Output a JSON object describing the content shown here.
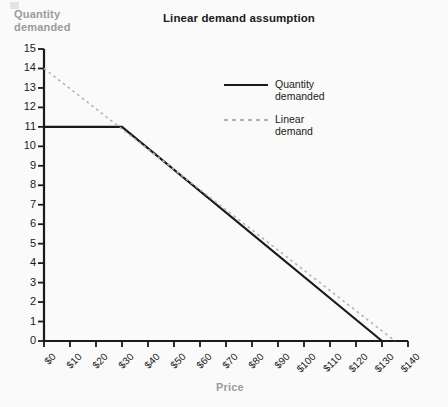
{
  "chart_data": {
    "type": "line",
    "title": "Linear demand assumption",
    "xlabel": "Price",
    "ylabel": "Quantity\ndemanded",
    "xlim": [
      0,
      140
    ],
    "ylim": [
      0,
      15
    ],
    "grid": false,
    "legend_position": "upper-center-right",
    "x_tick_labels": [
      "$0",
      "$10",
      "$20",
      "$30",
      "$40",
      "$50",
      "$60",
      "$70",
      "$80",
      "$90",
      "$100",
      "$110",
      "$120",
      "$130",
      "$140"
    ],
    "x_tick_values": [
      0,
      10,
      20,
      30,
      40,
      50,
      60,
      70,
      80,
      90,
      100,
      110,
      120,
      130,
      140
    ],
    "y_tick_labels": [
      "0",
      "1",
      "2",
      "3",
      "4",
      "5",
      "6",
      "7",
      "8",
      "9",
      "10",
      "11",
      "12",
      "13",
      "14",
      "15"
    ],
    "y_tick_values": [
      0,
      1,
      2,
      3,
      4,
      5,
      6,
      7,
      8,
      9,
      10,
      11,
      12,
      13,
      14,
      15
    ],
    "series": [
      {
        "name": "Quantity\ndemanded",
        "legend_label": "Quantity\ndemanded",
        "style": "solid",
        "color": "#1a1a1a",
        "width": 2.2,
        "points": [
          [
            0,
            11
          ],
          [
            30,
            11
          ],
          [
            130,
            0
          ]
        ]
      },
      {
        "name": "Linear\ndemand",
        "legend_label": "Linear\ndemand",
        "style": "dashed",
        "color": "#b3b3b3",
        "width": 1.6,
        "points": [
          [
            0,
            14
          ],
          [
            135,
            0
          ]
        ]
      }
    ]
  },
  "colors": {
    "background": "#fafafa",
    "axis": "#1a1a1a",
    "axis_title": "#9b9b9b",
    "series_solid": "#1a1a1a",
    "series_dashed": "#b3b3b3"
  }
}
